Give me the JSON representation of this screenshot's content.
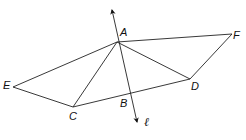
{
  "diagram": {
    "points": {
      "A": {
        "label": "A",
        "x": 117,
        "y": 42
      },
      "B": {
        "label": "B",
        "x": 131,
        "y": 96
      },
      "C": {
        "label": "C",
        "x": 73,
        "y": 107
      },
      "D": {
        "label": "D",
        "x": 190,
        "y": 79
      },
      "E": {
        "label": "E",
        "x": 13,
        "y": 87
      },
      "F": {
        "label": "F",
        "x": 232,
        "y": 34
      }
    },
    "segments": [
      [
        "A",
        "F"
      ],
      [
        "F",
        "D"
      ],
      [
        "A",
        "D"
      ],
      [
        "A",
        "C"
      ],
      [
        "A",
        "E"
      ],
      [
        "E",
        "C"
      ],
      [
        "C",
        "D"
      ]
    ],
    "line": {
      "label": "ℓ",
      "from": {
        "x": 111,
        "y": 8
      },
      "to": {
        "x": 138,
        "y": 125
      },
      "arrows": "both"
    },
    "labels": {
      "A": "A",
      "B": "B",
      "C": "C",
      "D": "D",
      "E": "E",
      "F": "F",
      "line_l": "ℓ"
    },
    "stroke_color": "#222222"
  }
}
